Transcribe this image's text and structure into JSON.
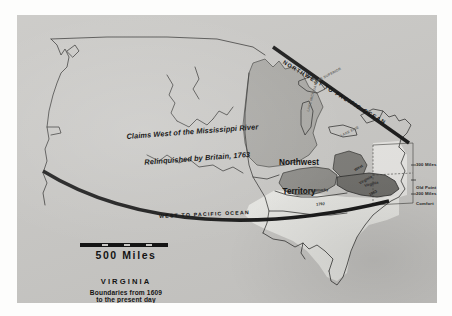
{
  "map": {
    "title_block": {
      "title": "VIRGINIA",
      "subtitle_line1": "Boundaries from 1609",
      "subtitle_line2": "to the present day"
    },
    "scale": {
      "label": "500  Miles"
    },
    "annotations": {
      "claims_line1": "Claims West of the Mississippi River",
      "claims_line2": "Relinquished by Britain, 1763",
      "northwest_territory_line1": "Northwest",
      "northwest_territory_line2": "Territory",
      "northwest_to_pacific": "NORTHWEST TO PACIFIC OCEAN",
      "west_to_pacific": "WEST TO PACIFIC OCEAN"
    },
    "margin_callouts": {
      "miles_300": "300 Miles",
      "old_point_line1": "Old Point",
      "old_point_line2": "Comfort",
      "miles_200": "200 Miles"
    },
    "regions": {
      "kentucky_line1": "Kentucky",
      "kentucky_line2": "1792",
      "west_virginia_line1": "West",
      "west_virginia_line2": "Virginia",
      "west_virginia_line3": "1863",
      "virginia": "Virginia"
    },
    "lakes": {
      "superior": "LAKE SUPERIOR",
      "michigan": "LAKE MICHIGAN",
      "erie": "LAKE ERIE"
    },
    "colors": {
      "paper": "#c9c8c5",
      "page": "#fdfdfc",
      "ink": "#1b1b1b",
      "territory_light": "#a8a7a3",
      "territory_mid": "#8d8c88",
      "territory_dark": "#6f6e6a",
      "landmass": "#efeeea"
    }
  }
}
